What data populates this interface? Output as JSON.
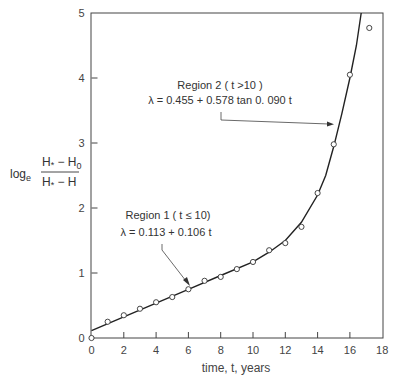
{
  "chart_data": {
    "type": "line",
    "title": "",
    "xlabel": "time, t, years",
    "ylabel": "log_e (H* − H0) / (H* − H)",
    "ylabel_parts": {
      "log": "log",
      "log_sub": "e",
      "num_main": "H",
      "num_star": "*",
      "num_rest": " − H",
      "num_sub": "0",
      "den_main": "H",
      "den_star": "*",
      "den_rest": " − H"
    },
    "xlim": [
      0,
      18
    ],
    "ylim": [
      0,
      5
    ],
    "xticks": [
      "0",
      "2",
      "4",
      "6",
      "8",
      "10",
      "12",
      "14",
      "16",
      "18"
    ],
    "yticks": [
      "0",
      "1",
      "2",
      "3",
      "4",
      "5"
    ],
    "grid": false,
    "series": [
      {
        "name": "observed",
        "style": "open-circle markers",
        "x": [
          0,
          1,
          2,
          3,
          4,
          5,
          6,
          7,
          8,
          9,
          10,
          11,
          12,
          13,
          14,
          15,
          16,
          17.2
        ],
        "y": [
          0.0,
          0.25,
          0.35,
          0.45,
          0.55,
          0.63,
          0.75,
          0.88,
          0.94,
          1.06,
          1.17,
          1.35,
          1.46,
          1.71,
          2.23,
          2.98,
          4.05,
          4.77
        ]
      },
      {
        "name": "fitted model",
        "style": "solid line",
        "x": [
          0,
          2,
          4,
          6,
          8,
          10,
          11,
          12,
          13,
          14,
          14.5,
          15,
          15.5,
          16,
          16.4,
          16.7
        ],
        "y": [
          0.113,
          0.325,
          0.537,
          0.749,
          0.961,
          1.173,
          1.32,
          1.5,
          1.78,
          2.2,
          2.5,
          2.95,
          3.45,
          4.0,
          4.5,
          5.0
        ]
      }
    ],
    "annotations": [
      {
        "id": "region1",
        "title": "Region 1 ( t ≤ 10)",
        "equation": "λ =  0.113 + 0.106 t",
        "points_to": {
          "t": 6,
          "y": 0.75
        }
      },
      {
        "id": "region2",
        "title": "Region 2 ( t >10 )",
        "equation": "λ = 0.455 + 0.578 tan 0. 090 t",
        "points_to": {
          "t": 15.3,
          "y": 3.2
        }
      }
    ]
  }
}
